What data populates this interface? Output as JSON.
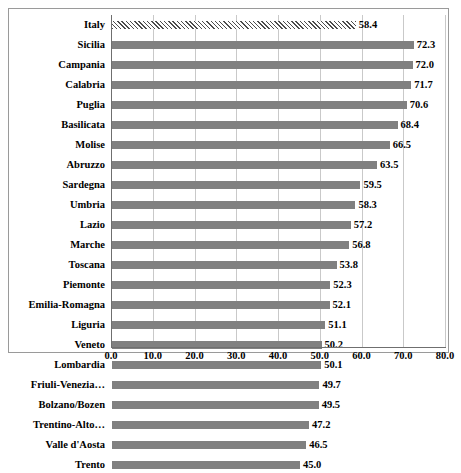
{
  "chart_data": {
    "type": "bar",
    "orientation": "horizontal",
    "title": "",
    "xlabel": "",
    "ylabel": "",
    "xlim": [
      0.0,
      80.0
    ],
    "xticks": [
      "0.0",
      "10.0",
      "20.0",
      "30.0",
      "40.0",
      "50.0",
      "60.0",
      "70.0",
      "80.0"
    ],
    "grid": true,
    "legend": "none",
    "bar_color": "#808080",
    "highlight_pattern": "diagonal-hatch",
    "categories": [
      "Italy",
      "Sicilia",
      "Campania",
      "Calabria",
      "Puglia",
      "Basilicata",
      "Molise",
      "Abruzzo",
      "Sardegna",
      "Umbria",
      "Lazio",
      "Marche",
      "Toscana",
      "Piemonte",
      "Emilia-Romagna",
      "Liguria",
      "Veneto",
      "Lombardia",
      "Friuli-Venezia…",
      "Bolzano/Bozen",
      "Trentino-Alto…",
      "Valle d'Aosta",
      "Trento"
    ],
    "values": [
      58.4,
      72.3,
      72.0,
      71.7,
      70.6,
      68.4,
      66.5,
      63.5,
      59.5,
      58.3,
      57.2,
      56.8,
      53.8,
      52.3,
      52.1,
      51.1,
      50.2,
      50.1,
      49.7,
      49.5,
      47.2,
      46.5,
      45.0
    ],
    "value_labels": [
      "58.4",
      "72.3",
      "72.0",
      "71.7",
      "70.6",
      "68.4",
      "66.5",
      "63.5",
      "59.5",
      "58.3",
      "57.2",
      "56.8",
      "53.8",
      "52.3",
      "52.1",
      "51.1",
      "50.2",
      "50.1",
      "49.7",
      "49.5",
      "47.2",
      "46.5",
      "45.0"
    ],
    "highlighted_categories": [
      "Italy"
    ]
  }
}
